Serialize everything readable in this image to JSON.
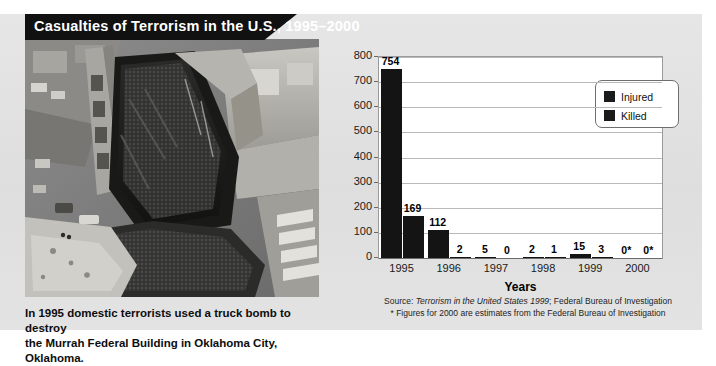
{
  "title": "Casualties of Terrorism in the U.S., 1995–2000",
  "photo": {
    "alt": "Aerial black-and-white photograph of the bombed Alfred P. Murrah Federal Building",
    "caption_line1": "In 1995 domestic terrorists used a truck bomb to destroy",
    "caption_line2": "the Murrah Federal Building in Oklahoma City, Oklahoma."
  },
  "legend": {
    "items": [
      {
        "label": "Injured",
        "color": "#1b1b1b"
      },
      {
        "label": "Killed",
        "color": "#1b1b1b"
      }
    ]
  },
  "source": {
    "line1_prefix": "Source: ",
    "line1_italic": "Terrorism in the United States 1999",
    "line1_suffix": "; Federal Bureau of Investigation",
    "line2": "* Figures for 2000 are estimates from the Federal Bureau of Investigation"
  },
  "chart_data": {
    "type": "bar",
    "title": "Casualties of Terrorism in the U.S., 1995–2000",
    "xlabel": "Years",
    "ylabel": "",
    "categories": [
      "1995",
      "1996",
      "1997",
      "1998",
      "1999",
      "2000"
    ],
    "series": [
      {
        "name": "Injured",
        "values": [
          754,
          112,
          5,
          2,
          15,
          0
        ],
        "labels": [
          "754",
          "112",
          "5",
          "2",
          "15",
          "0*"
        ]
      },
      {
        "name": "Killed",
        "values": [
          169,
          2,
          0,
          1,
          3,
          0
        ],
        "labels": [
          "169",
          "2",
          "0",
          "1",
          "3",
          "0*"
        ]
      }
    ],
    "ylim": [
      0,
      800
    ],
    "yticks": [
      "800",
      "700",
      "600",
      "500",
      "400",
      "300",
      "200",
      "100",
      "0"
    ],
    "grid": true,
    "legend_position": "upper right",
    "bar_color": "#141414"
  }
}
